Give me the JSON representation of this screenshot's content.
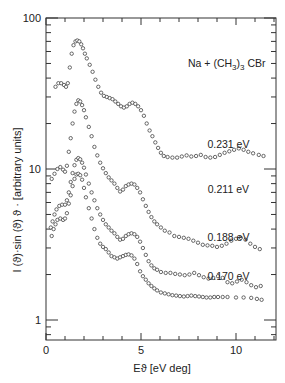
{
  "chart_data": {
    "type": "scatter",
    "title": "Na + (CH3)3 CBr",
    "title_parts": {
      "pre": "Na + (CH",
      "sub1": "3",
      "mid": ")",
      "sub2": "3",
      "post": " CBr"
    },
    "xlabel": "Eϑ [eV deg]",
    "ylabel": "I (ϑ)·sin (ϑ) ϑ · [arbitrary units]",
    "xlim": [
      0,
      12.05
    ],
    "ylim": [
      0.74,
      100
    ],
    "yscale": "log",
    "grid": false,
    "legend": "none (inline curve labels)",
    "x_ticks": [
      0,
      5,
      10
    ],
    "x_tick_labels": [
      "0",
      "5",
      "10"
    ],
    "y_ticks": [
      1,
      10,
      100
    ],
    "y_tick_labels": [
      "1",
      "10",
      "100"
    ],
    "series": [
      {
        "name": "0.231 eV",
        "label_pos": {
          "x": 9.6,
          "y": 13.8
        },
        "points": [
          [
            0.5,
            35
          ],
          [
            0.65,
            37
          ],
          [
            0.8,
            37
          ],
          [
            0.95,
            36
          ],
          [
            1.05,
            35
          ],
          [
            1.15,
            37
          ],
          [
            1.25,
            47
          ],
          [
            1.35,
            58
          ],
          [
            1.45,
            66
          ],
          [
            1.55,
            70
          ],
          [
            1.65,
            71
          ],
          [
            1.75,
            70
          ],
          [
            1.85,
            67
          ],
          [
            1.95,
            63
          ],
          [
            2.05,
            58
          ],
          [
            2.15,
            54
          ],
          [
            2.3,
            49
          ],
          [
            2.45,
            44
          ],
          [
            2.6,
            39
          ],
          [
            2.75,
            35
          ],
          [
            2.9,
            32
          ],
          [
            3.05,
            30.5
          ],
          [
            3.2,
            30
          ],
          [
            3.35,
            29.5
          ],
          [
            3.5,
            29
          ],
          [
            3.65,
            28
          ],
          [
            3.8,
            27
          ],
          [
            3.95,
            26
          ],
          [
            4.1,
            25.5
          ],
          [
            4.25,
            26
          ],
          [
            4.4,
            27
          ],
          [
            4.55,
            27.5
          ],
          [
            4.7,
            27
          ],
          [
            4.85,
            26
          ],
          [
            5.0,
            24.5
          ],
          [
            5.15,
            22.5
          ],
          [
            5.3,
            20
          ],
          [
            5.45,
            18
          ],
          [
            5.6,
            16.5
          ],
          [
            5.75,
            15
          ],
          [
            5.9,
            13.8
          ],
          [
            6.05,
            12.8
          ],
          [
            6.2,
            12.2
          ],
          [
            6.4,
            12
          ],
          [
            6.65,
            11.9
          ],
          [
            6.9,
            11.9
          ],
          [
            7.15,
            12.1
          ],
          [
            7.4,
            12.3
          ],
          [
            7.65,
            12.1
          ],
          [
            7.9,
            12.2
          ],
          [
            8.15,
            12.4
          ],
          [
            8.4,
            12
          ],
          [
            8.65,
            11.9
          ],
          [
            8.9,
            12
          ],
          [
            9.15,
            12.4
          ],
          [
            9.4,
            12.8
          ],
          [
            9.65,
            13.1
          ],
          [
            9.9,
            13.4
          ],
          [
            10.15,
            13.7
          ],
          [
            10.4,
            13.4
          ],
          [
            10.65,
            13
          ],
          [
            10.9,
            12.7
          ],
          [
            11.2,
            12.4
          ],
          [
            11.45,
            12.2
          ]
        ]
      },
      {
        "name": "0.211 eV",
        "label_pos": {
          "x": 9.6,
          "y": 6.9
        },
        "points": [
          [
            0.3,
            8.6
          ],
          [
            0.45,
            9.3
          ],
          [
            0.6,
            10
          ],
          [
            0.75,
            10.3
          ],
          [
            0.9,
            9.9
          ],
          [
            1.0,
            9.6
          ],
          [
            1.1,
            10.5
          ],
          [
            1.2,
            13
          ],
          [
            1.3,
            16
          ],
          [
            1.4,
            20
          ],
          [
            1.5,
            24
          ],
          [
            1.6,
            27
          ],
          [
            1.7,
            28.5
          ],
          [
            1.8,
            28
          ],
          [
            1.9,
            26.5
          ],
          [
            2.0,
            24.5
          ],
          [
            2.1,
            22
          ],
          [
            2.25,
            19
          ],
          [
            2.4,
            16.5
          ],
          [
            2.55,
            14
          ],
          [
            2.7,
            12.3
          ],
          [
            2.85,
            11
          ],
          [
            3.0,
            10.1
          ],
          [
            3.15,
            9.4
          ],
          [
            3.3,
            8.8
          ],
          [
            3.45,
            8.4
          ],
          [
            3.6,
            8
          ],
          [
            3.75,
            7.5
          ],
          [
            3.9,
            7.1
          ],
          [
            4.05,
            7.3
          ],
          [
            4.2,
            7.7
          ],
          [
            4.35,
            7.9
          ],
          [
            4.5,
            8
          ],
          [
            4.65,
            7.9
          ],
          [
            4.8,
            7.5
          ],
          [
            4.95,
            7
          ],
          [
            5.1,
            6.3
          ],
          [
            5.25,
            5.7
          ],
          [
            5.4,
            5.2
          ],
          [
            5.55,
            4.8
          ],
          [
            5.7,
            4.5
          ],
          [
            5.85,
            4.3
          ],
          [
            6.05,
            4.1
          ],
          [
            6.25,
            3.9
          ],
          [
            6.5,
            3.8
          ],
          [
            6.75,
            3.6
          ],
          [
            7.0,
            3.55
          ],
          [
            7.25,
            3.5
          ],
          [
            7.5,
            3.45
          ],
          [
            7.75,
            3.35
          ],
          [
            8.0,
            3.25
          ],
          [
            8.25,
            3.15
          ],
          [
            8.5,
            3.12
          ],
          [
            8.75,
            3.1
          ],
          [
            9.0,
            3.05
          ],
          [
            9.25,
            3.1
          ],
          [
            9.5,
            3.2
          ],
          [
            9.75,
            3.35
          ],
          [
            10.0,
            3.45
          ],
          [
            10.25,
            3.5
          ],
          [
            10.5,
            3.4
          ],
          [
            10.75,
            3.2
          ],
          [
            11.0,
            3.05
          ],
          [
            11.25,
            2.95
          ]
        ]
      },
      {
        "name": "0.188 eV",
        "label_pos": {
          "x": 9.6,
          "y": 3.35
        },
        "points": [
          [
            0.25,
            4.1
          ],
          [
            0.35,
            4.5
          ],
          [
            0.45,
            5
          ],
          [
            0.55,
            5.4
          ],
          [
            0.7,
            5.7
          ],
          [
            0.85,
            5.8
          ],
          [
            1.0,
            5.8
          ],
          [
            1.1,
            6.2
          ],
          [
            1.2,
            7
          ],
          [
            1.3,
            8.2
          ],
          [
            1.4,
            9.4
          ],
          [
            1.5,
            10.6
          ],
          [
            1.6,
            11.5
          ],
          [
            1.7,
            11.8
          ],
          [
            1.8,
            11.6
          ],
          [
            1.9,
            11
          ],
          [
            2.0,
            10.2
          ],
          [
            2.1,
            9.2
          ],
          [
            2.25,
            8
          ],
          [
            2.4,
            7
          ],
          [
            2.55,
            6.2
          ],
          [
            2.7,
            5.5
          ],
          [
            2.85,
            5
          ],
          [
            3.0,
            4.6
          ],
          [
            3.15,
            4.3
          ],
          [
            3.3,
            4.1
          ],
          [
            3.45,
            3.9
          ],
          [
            3.6,
            3.75
          ],
          [
            3.75,
            3.55
          ],
          [
            3.9,
            3.4
          ],
          [
            4.05,
            3.45
          ],
          [
            4.2,
            3.6
          ],
          [
            4.35,
            3.7
          ],
          [
            4.5,
            3.75
          ],
          [
            4.65,
            3.7
          ],
          [
            4.8,
            3.55
          ],
          [
            4.95,
            3.3
          ],
          [
            5.1,
            3
          ],
          [
            5.25,
            2.7
          ],
          [
            5.4,
            2.45
          ],
          [
            5.55,
            2.3
          ],
          [
            5.7,
            2.2
          ],
          [
            5.85,
            2.15
          ],
          [
            6.05,
            2.08
          ],
          [
            6.3,
            2.05
          ],
          [
            6.55,
            2.05
          ],
          [
            6.8,
            2.02
          ],
          [
            7.05,
            2.0
          ],
          [
            7.3,
            1.98
          ],
          [
            7.55,
            2.0
          ],
          [
            7.8,
            2.05
          ],
          [
            8.05,
            1.98
          ],
          [
            8.3,
            1.92
          ],
          [
            8.55,
            1.88
          ],
          [
            8.8,
            1.9
          ],
          [
            9.05,
            1.95
          ],
          [
            9.3,
            1.9
          ],
          [
            9.55,
            1.78
          ],
          [
            9.8,
            1.75
          ],
          [
            10.05,
            1.8
          ],
          [
            10.3,
            1.85
          ],
          [
            10.55,
            1.78
          ],
          [
            10.8,
            1.7
          ],
          [
            11.05,
            1.65
          ],
          [
            11.3,
            1.68
          ]
        ]
      },
      {
        "name": "0.170 eV",
        "label_pos": {
          "x": 9.6,
          "y": 1.85
        },
        "points": [
          [
            0.3,
            3.6
          ],
          [
            0.4,
            4.0
          ],
          [
            0.5,
            4.3
          ],
          [
            0.6,
            4.6
          ],
          [
            0.75,
            4.7
          ],
          [
            0.9,
            4.6
          ],
          [
            1.0,
            4.7
          ],
          [
            1.1,
            5.1
          ],
          [
            1.2,
            5.9
          ],
          [
            1.3,
            6.7
          ],
          [
            1.4,
            7.7
          ],
          [
            1.5,
            8.6
          ],
          [
            1.6,
            9.2
          ],
          [
            1.7,
            9.3
          ],
          [
            1.8,
            9.1
          ],
          [
            1.9,
            8.5
          ],
          [
            2.0,
            7.5
          ],
          [
            2.1,
            6.5
          ],
          [
            2.25,
            5.5
          ],
          [
            2.4,
            4.7
          ],
          [
            2.55,
            4.0
          ],
          [
            2.7,
            3.5
          ],
          [
            2.85,
            3.2
          ],
          [
            3.0,
            3.05
          ],
          [
            3.15,
            2.95
          ],
          [
            3.3,
            2.8
          ],
          [
            3.45,
            2.65
          ],
          [
            3.6,
            2.6
          ],
          [
            3.75,
            2.55
          ],
          [
            3.9,
            2.6
          ],
          [
            4.05,
            2.65
          ],
          [
            4.2,
            2.7
          ],
          [
            4.35,
            2.72
          ],
          [
            4.5,
            2.68
          ],
          [
            4.65,
            2.55
          ],
          [
            4.8,
            2.35
          ],
          [
            4.95,
            2.1
          ],
          [
            5.1,
            1.95
          ],
          [
            5.25,
            1.85
          ],
          [
            5.4,
            1.75
          ],
          [
            5.55,
            1.68
          ],
          [
            5.7,
            1.62
          ],
          [
            5.85,
            1.57
          ],
          [
            6.05,
            1.52
          ],
          [
            6.25,
            1.5
          ],
          [
            6.45,
            1.48
          ],
          [
            6.65,
            1.46
          ],
          [
            6.85,
            1.45
          ],
          [
            7.05,
            1.44
          ],
          [
            7.25,
            1.43
          ],
          [
            7.45,
            1.44
          ],
          [
            7.65,
            1.45
          ],
          [
            7.85,
            1.44
          ],
          [
            8.05,
            1.43
          ],
          [
            8.25,
            1.42
          ],
          [
            8.45,
            1.41
          ],
          [
            8.65,
            1.41
          ],
          [
            8.85,
            1.42
          ],
          [
            9.05,
            1.42
          ],
          [
            9.3,
            1.42
          ],
          [
            9.55,
            1.42
          ],
          [
            10.0,
            1.41
          ],
          [
            10.4,
            1.41
          ],
          [
            10.8,
            1.4
          ],
          [
            11.1,
            1.38
          ],
          [
            11.35,
            1.36
          ]
        ]
      }
    ]
  }
}
